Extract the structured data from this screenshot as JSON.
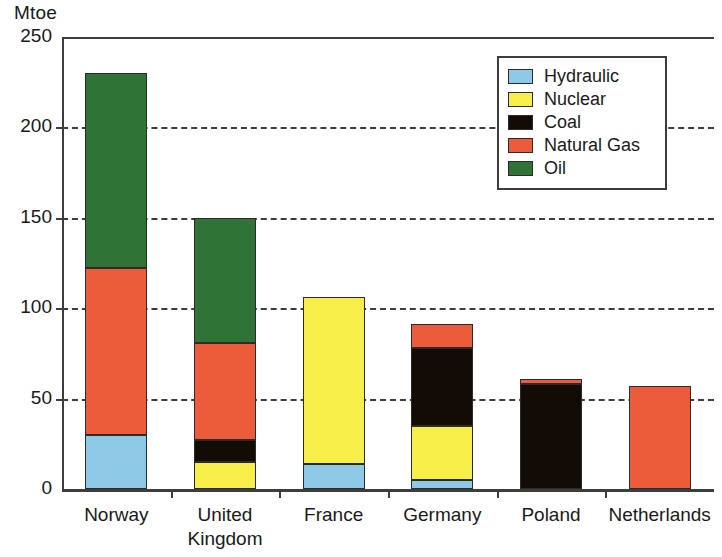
{
  "chart_data": {
    "type": "bar",
    "subtype": "stacked-vertical",
    "title": "",
    "xlabel": "",
    "ylabel": "Mtoe",
    "ylim": [
      0,
      250
    ],
    "yticks": [
      0,
      50,
      100,
      150,
      200,
      250
    ],
    "ytick_labels": [
      "0",
      "50",
      "100",
      "150",
      "200",
      "250"
    ],
    "grid": "horizontal-dashed",
    "legend_position": "top-right",
    "categories": [
      "Norway",
      "United Kingdom",
      "France",
      "Germany",
      "Poland",
      "Netherlands"
    ],
    "category_lines": [
      [
        "Norway"
      ],
      [
        "United",
        "Kingdom"
      ],
      [
        "France"
      ],
      [
        "Germany"
      ],
      [
        "Poland"
      ],
      [
        "Netherlands"
      ]
    ],
    "series": [
      {
        "name": "Hydraulic",
        "color": "#8FC9E8",
        "values": [
          30,
          0,
          14,
          5,
          0,
          0
        ]
      },
      {
        "name": "Nuclear",
        "color": "#F7EE4A",
        "values": [
          0,
          15,
          92,
          30,
          0,
          0
        ]
      },
      {
        "name": "Coal",
        "color": "#120B06",
        "values": [
          0,
          12,
          0,
          43,
          58,
          0
        ]
      },
      {
        "name": "Natural Gas",
        "color": "#EC5B3A",
        "values": [
          92,
          54,
          0,
          13,
          3,
          57
        ]
      },
      {
        "name": "Oil",
        "color": "#2F7337",
        "values": [
          108,
          69,
          0,
          0,
          0,
          0
        ]
      }
    ],
    "totals": [
      230,
      150,
      106,
      91,
      61,
      57
    ]
  },
  "legend": {
    "items": [
      {
        "label": "Hydraulic",
        "color": "#8FC9E8"
      },
      {
        "label": "Nuclear",
        "color": "#F7EE4A"
      },
      {
        "label": "Coal",
        "color": "#120B06"
      },
      {
        "label": "Natural Gas",
        "color": "#EC5B3A"
      },
      {
        "label": "Oil",
        "color": "#2F7337"
      }
    ]
  },
  "axes": {
    "y_unit_label": "Mtoe",
    "y_tick_labels": [
      "250",
      "200",
      "150",
      "100",
      "50",
      "0"
    ]
  },
  "colors": {
    "axis": "#3d3d3d",
    "text": "#1a1a1a",
    "background": "#ffffff"
  }
}
